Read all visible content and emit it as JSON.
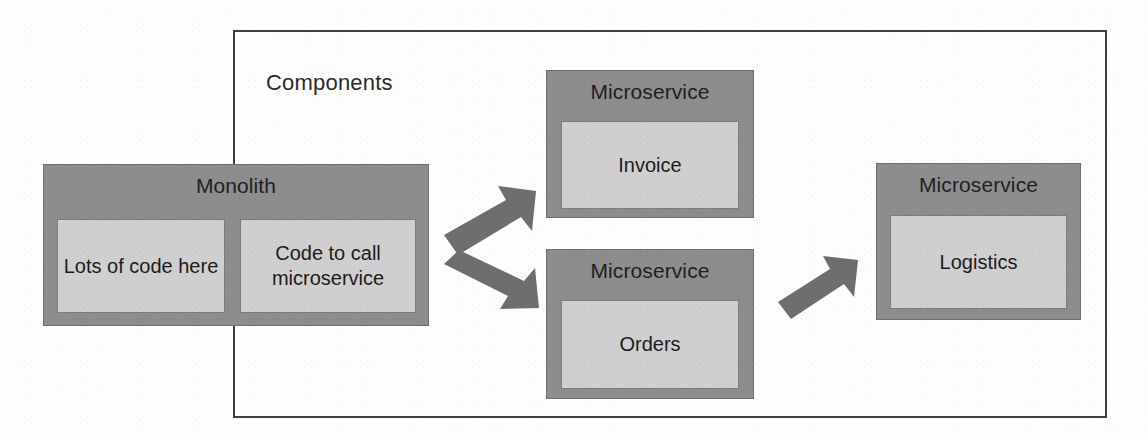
{
  "diagram": {
    "type": "architecture-block-diagram",
    "boundary": {
      "label": "Components"
    },
    "monolith": {
      "title": "Monolith",
      "panels": [
        {
          "text": "Lots of code here"
        },
        {
          "text": "Code to call microservice"
        }
      ]
    },
    "microservices": [
      {
        "title": "Microservice",
        "name": "Invoice"
      },
      {
        "title": "Microservice",
        "name": "Orders"
      },
      {
        "title": "Microservice",
        "name": "Logistics"
      }
    ],
    "arrows": [
      {
        "name": "monolith-to-invoice",
        "direction": "up-right"
      },
      {
        "name": "monolith-to-orders",
        "direction": "down-right"
      },
      {
        "name": "orders-to-logistics",
        "direction": "up-right"
      }
    ],
    "colors": {
      "shell_fill": "#8d8d8d",
      "panel_fill": "#cfcfcf",
      "arrow_fill": "#6e6e6e",
      "boundary_stroke": "#3f3f3f",
      "text": "#1c1c1c",
      "background": "#fdfdfd"
    }
  }
}
